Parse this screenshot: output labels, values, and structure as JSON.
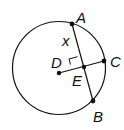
{
  "diagram": {
    "type": "circle geometry",
    "circle": {
      "cx": 59,
      "cy": 68,
      "r": 46.5,
      "stroke": "#111111"
    },
    "points": {
      "A": {
        "x": 72,
        "y": 24,
        "label": "A"
      },
      "B": {
        "x": 93,
        "y": 101,
        "label": "B"
      },
      "C": {
        "x": 104,
        "y": 61,
        "label": "C"
      },
      "D": {
        "x": 59,
        "y": 73,
        "label": "D"
      },
      "E": {
        "x": 84,
        "y": 67,
        "label": "E"
      }
    },
    "segment_label": {
      "text": "x",
      "segment": "AE"
    },
    "right_angle_at": "E"
  }
}
